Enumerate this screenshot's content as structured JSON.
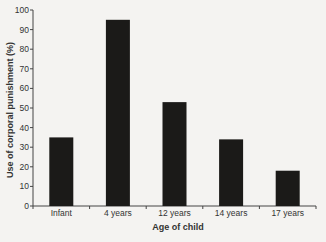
{
  "chart_data": {
    "type": "bar",
    "title": "",
    "xlabel": "Age of child",
    "ylabel": "Use of corporal punishment (%)",
    "categories": [
      "Infant",
      "4 years",
      "12 years",
      "14 years",
      "17 years"
    ],
    "values": [
      35,
      95,
      53,
      34,
      18
    ],
    "ylim": [
      0,
      100
    ],
    "yticks": [
      0,
      10,
      20,
      30,
      40,
      50,
      60,
      70,
      80,
      90,
      100
    ],
    "grid": false,
    "legend": null,
    "bar_color": "#1b1a18"
  }
}
